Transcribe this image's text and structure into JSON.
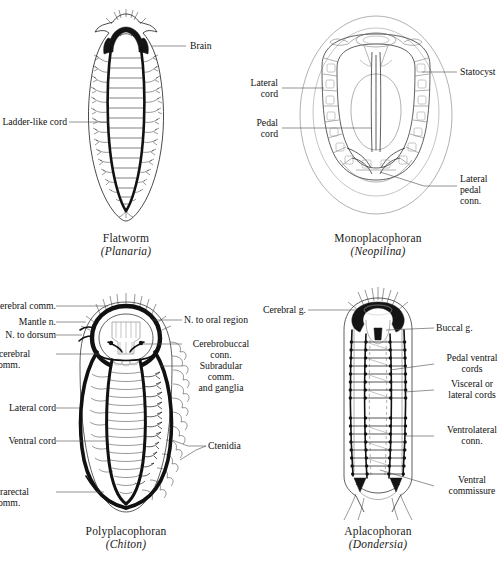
{
  "figure": {
    "background_color": "#ffffff",
    "ink_color": "#1b1b1b",
    "leader_color": "#4a4a4a"
  },
  "panels": [
    {
      "id": "flatworm",
      "caption_common": "Flatworm",
      "caption_genus": "(Planaria)",
      "labels": [
        {
          "name": "brain",
          "text": "Brain",
          "align": "left"
        },
        {
          "name": "ladder-like-cord",
          "text": "Ladder-like cord",
          "align": "right"
        }
      ]
    },
    {
      "id": "monoplacophoran",
      "caption_common": "Monoplacophoran",
      "caption_genus": "(Neopilina)",
      "labels": [
        {
          "name": "statocyst",
          "text": "Statocyst",
          "align": "left"
        },
        {
          "name": "lateral-cord",
          "text": "Lateral\ncord",
          "align": "right"
        },
        {
          "name": "pedal-cord",
          "text": "Pedal\ncord",
          "align": "right"
        },
        {
          "name": "lateral-pedal-conn",
          "text": "Lateral\npedal conn.",
          "align": "left"
        }
      ]
    },
    {
      "id": "polyplacophoran",
      "caption_common": "Polyplacophoran",
      "caption_genus": "(Chiton)",
      "labels": [
        {
          "name": "cerebral-comm",
          "text": "Cerebral comm.",
          "align": "right"
        },
        {
          "name": "mantle-n",
          "text": "Mantle n.",
          "align": "right"
        },
        {
          "name": "n-to-dorsum",
          "text": "N. to dorsum",
          "align": "right"
        },
        {
          "name": "subcerebral-comm",
          "text": "Subcerebral\ncomm.",
          "align": "right"
        },
        {
          "name": "lateral-cord",
          "text": "Lateral cord",
          "align": "right"
        },
        {
          "name": "ventral-cord",
          "text": "Ventral cord",
          "align": "right"
        },
        {
          "name": "suprarectal-comm",
          "text": "Suprarectal\ncomm.",
          "align": "right"
        },
        {
          "name": "n-to-oral-region",
          "text": "N. to oral region",
          "align": "left"
        },
        {
          "name": "cerebrobuccal-conn",
          "text": "Cerebrobuccal\nconn.",
          "align": "left"
        },
        {
          "name": "subradular-comm-and-ganglia",
          "text": "Subradular\ncomm.\nand ganglia",
          "align": "left"
        },
        {
          "name": "ctenidia",
          "text": "Ctenidia",
          "align": "left"
        }
      ]
    },
    {
      "id": "aplacophoran",
      "caption_common": "Aplacophoran",
      "caption_genus": "(Dondersia)",
      "labels": [
        {
          "name": "cerebral-g",
          "text": "Cerebral g.",
          "align": "right"
        },
        {
          "name": "buccal-g",
          "text": "Buccal g.",
          "align": "left"
        },
        {
          "name": "pedal-ventral-cords",
          "text": "Pedal ventral\ncords",
          "align": "left"
        },
        {
          "name": "visceral-or-lateral-cords",
          "text": "Visceral or\nlateral cords",
          "align": "left"
        },
        {
          "name": "ventrolateral-conn",
          "text": "Ventrolateral\nconn.",
          "align": "left"
        },
        {
          "name": "ventral-commissure",
          "text": "Ventral\ncommissure",
          "align": "left"
        }
      ]
    }
  ]
}
